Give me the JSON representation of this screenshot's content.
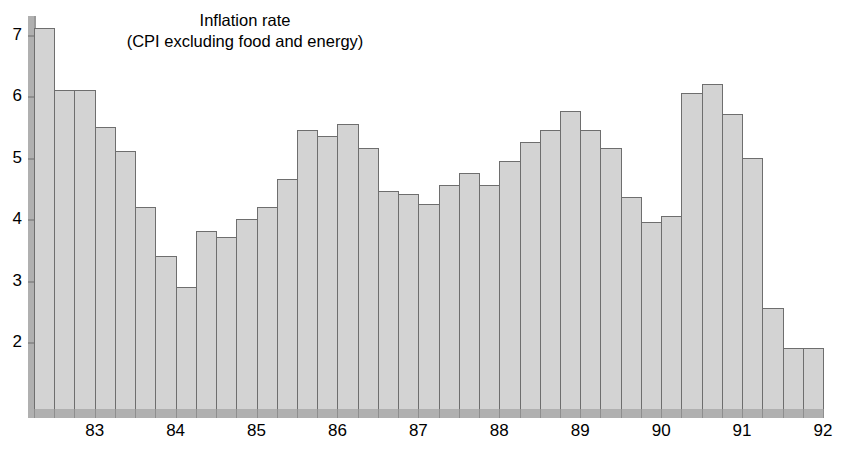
{
  "chart_data": {
    "type": "bar",
    "title": "Inflation rate",
    "subtitle": "(CPI excluding food and energy)",
    "xlabel": "",
    "ylabel": "",
    "ylim": [
      0.9,
      7.3
    ],
    "yticks": [
      2,
      3,
      4,
      5,
      6,
      7
    ],
    "ytick_labels": [
      "2",
      "3",
      "4",
      "5",
      "6",
      "7"
    ],
    "xtick_labels": [
      "83",
      "84",
      "85",
      "86",
      "87",
      "88",
      "89",
      "90",
      "91",
      "92"
    ],
    "grid": false,
    "legend": null,
    "bar_color": "#d3d3d3",
    "bar_edge_color": "#6e6e6e",
    "axis_color": "#b0b0b0",
    "categories": [
      "82Q4",
      "83Q1",
      "83Q2",
      "83Q3",
      "83Q4",
      "84Q1",
      "84Q2",
      "84Q3",
      "84Q4",
      "85Q1",
      "85Q2",
      "85Q3",
      "85Q4",
      "86Q1",
      "86Q2",
      "86Q3",
      "86Q4",
      "87Q1",
      "87Q2",
      "87Q3",
      "87Q4",
      "88Q1",
      "88Q2",
      "88Q3",
      "88Q4",
      "89Q1",
      "89Q2",
      "89Q3",
      "89Q4",
      "90Q1",
      "90Q2",
      "90Q3",
      "90Q4",
      "91Q1",
      "91Q2",
      "91Q3",
      "91Q4",
      "92Q1",
      "92Q2"
    ],
    "values": [
      7.1,
      6.1,
      6.1,
      5.5,
      5.1,
      4.2,
      3.4,
      2.9,
      3.8,
      3.7,
      4.0,
      4.2,
      4.65,
      5.45,
      5.35,
      5.55,
      5.15,
      4.45,
      4.4,
      4.25,
      4.55,
      4.75,
      4.55,
      4.95,
      5.25,
      5.45,
      5.75,
      5.45,
      5.15,
      4.35,
      3.95,
      4.05,
      6.05,
      6.2,
      5.7,
      5.0,
      2.55,
      1.9,
      1.9
    ]
  }
}
